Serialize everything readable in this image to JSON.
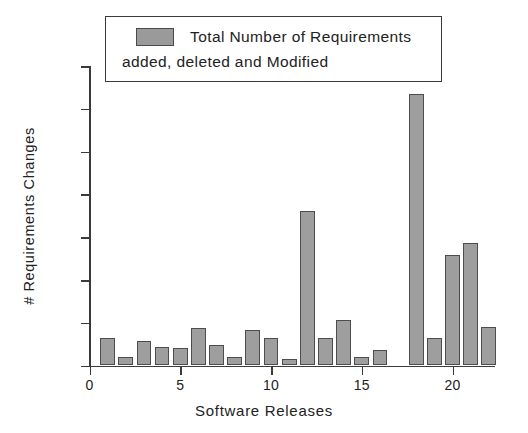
{
  "chart_data": {
    "type": "bar",
    "title": "",
    "xlabel": "Software Releases",
    "ylabel": "# Requirements Changes",
    "legend": {
      "position": "top",
      "entries": [
        {
          "line1": "Total Number of Requirements",
          "line2": "added, deleted and Modified",
          "color": "#9a9a9a"
        }
      ]
    },
    "categories": [
      1,
      2,
      3,
      4,
      5,
      6,
      7,
      8,
      9,
      10,
      11,
      12,
      13,
      14,
      15,
      16,
      17,
      18,
      19,
      20,
      21,
      22
    ],
    "values": [
      28,
      9,
      25,
      19,
      18,
      38,
      21,
      9,
      36,
      28,
      7,
      155,
      28,
      46,
      9,
      16,
      0,
      273,
      28,
      111,
      123,
      39
    ],
    "x": [
      0,
      5,
      10,
      15,
      20
    ],
    "xtick_labels": [
      "0",
      "5",
      "10",
      "15",
      "20"
    ],
    "xlim": [
      0,
      22.8
    ],
    "ylim": [
      0,
      301
    ],
    "ytick_count": 8,
    "ytick_labels": [
      "",
      "",
      "",
      "",
      "",
      "",
      "",
      ""
    ],
    "grid": false,
    "bar_fill": "#9e9e9e",
    "bar_edge": "#4d4d4d",
    "axis_color": "#3a3a3a"
  }
}
